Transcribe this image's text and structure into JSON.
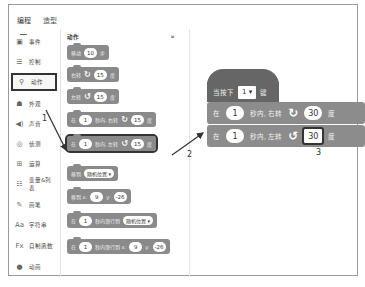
{
  "tabs": [
    {
      "label": "编程",
      "active": true
    },
    {
      "label": "造型",
      "active": false
    }
  ],
  "sidebar": {
    "items": [
      {
        "label": "事件",
        "icon": "event-icon"
      },
      {
        "label": "控制",
        "icon": "control-icon"
      },
      {
        "label": "动作",
        "icon": "motion-icon",
        "active": true
      },
      {
        "label": "外观",
        "icon": "looks-icon"
      },
      {
        "label": "声音",
        "icon": "sound-icon"
      },
      {
        "label": "侦测",
        "icon": "sensing-icon"
      },
      {
        "label": "运算",
        "icon": "operators-icon"
      },
      {
        "label": "变量&列表",
        "icon": "variables-icon"
      },
      {
        "label": "画笔",
        "icon": "pen-icon"
      },
      {
        "label": "字符串",
        "icon": "string-icon"
      },
      {
        "label": "自制函数",
        "icon": "function-icon"
      },
      {
        "label": "动画",
        "icon": "animation-icon"
      }
    ]
  },
  "palette": {
    "title": "动作",
    "blocks": [
      {
        "pre": "移动",
        "n1": "10",
        "post": "步"
      },
      {
        "pre": "右转",
        "rot": "↻",
        "n1": "15",
        "post": "度"
      },
      {
        "pre": "左转",
        "rot": "↺",
        "n1": "15",
        "post": "度"
      },
      {
        "pre": "在",
        "n1": "1",
        "mid": "秒内, 右转",
        "rot": "↻",
        "n2": "15",
        "post": "度"
      },
      {
        "pre": "在",
        "n1": "1",
        "mid": "秒内, 左转",
        "rot": "↺",
        "n2": "15",
        "post": "度"
      },
      {
        "pre": "移到",
        "drop": "随机位置 ▾"
      },
      {
        "pre": "移到 x:",
        "n1": "9",
        "mid": "y:",
        "n2": "-26"
      },
      {
        "pre": "在",
        "n1": "1",
        "mid": "秒内滑行到",
        "drop": "随机位置 ▾"
      },
      {
        "pre": "在",
        "n1": "1",
        "mid": "秒内滑行到 x:",
        "n2": "9",
        "mid2": "y:",
        "n3": "-26"
      }
    ]
  },
  "workspace": {
    "hat": {
      "pre": "当按下",
      "key": "1 ▾",
      "post": "键"
    },
    "blocks": [
      {
        "pre": "在",
        "n1": "1",
        "mid": "秒内, 右转",
        "rot": "↻",
        "n2": "30",
        "post": "度"
      },
      {
        "pre": "在",
        "n1": "1",
        "mid": "秒内, 左转",
        "rot": "↺",
        "n2": "30",
        "post": "度"
      }
    ]
  },
  "callouts": {
    "c1": "1",
    "c2": "2",
    "c3": "3"
  }
}
